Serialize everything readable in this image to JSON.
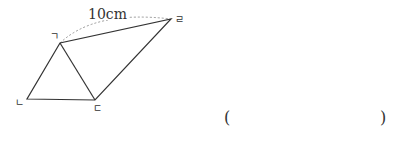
{
  "diagram": {
    "measure_label": "10cm",
    "vertices": {
      "a": {
        "label": "ㄱ",
        "x": 60,
        "y": 43
      },
      "b": {
        "label": "ㄴ",
        "x": 27,
        "y": 99
      },
      "c": {
        "label": "ㄷ",
        "x": 95,
        "y": 100
      },
      "d": {
        "label": "ㄹ",
        "x": 171,
        "y": 19
      }
    },
    "line_color": "#333333",
    "arc_color": "#999999"
  },
  "answer": {
    "open_paren": "(",
    "close_paren": ")"
  }
}
